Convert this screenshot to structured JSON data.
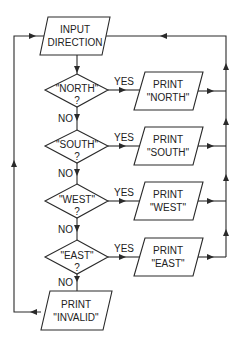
{
  "diagram": {
    "type": "flowchart",
    "input": {
      "line1": "INPUT",
      "line2": "DIRECTION"
    },
    "decisions": [
      {
        "line1": "\"NORTH\"",
        "line2": "?",
        "yes_label": "YES",
        "no_label": "NO",
        "print_line1": "PRINT",
        "print_line2": "\"NORTH\""
      },
      {
        "line1": "\"SOUTH\"",
        "line2": "?",
        "yes_label": "YES",
        "no_label": "NO",
        "print_line1": "PRINT",
        "print_line2": "\"SOUTH\""
      },
      {
        "line1": "\"WEST\"",
        "line2": "?",
        "yes_label": "YES",
        "no_label": "NO",
        "print_line1": "PRINT",
        "print_line2": "\"WEST\""
      },
      {
        "line1": "\"EAST\"",
        "line2": "?",
        "yes_label": "YES",
        "no_label": "NO",
        "print_line1": "PRINT",
        "print_line2": "\"EAST\""
      }
    ],
    "invalid": {
      "line1": "PRINT",
      "line2": "\"INVALID\""
    },
    "colors": {
      "line": "#2a2a2a",
      "background": "#ffffff"
    }
  }
}
